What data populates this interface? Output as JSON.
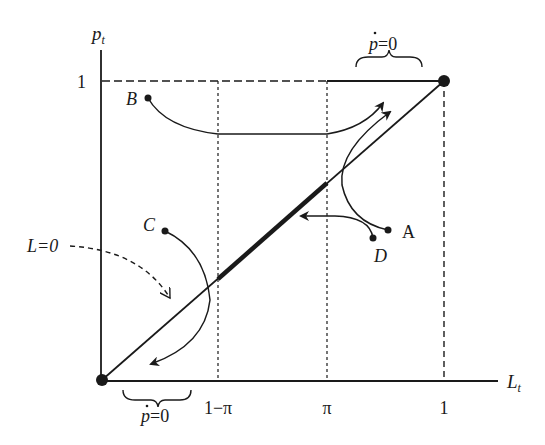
{
  "axes": {
    "y_label": "p",
    "y_label_sub": "t",
    "x_label": "L",
    "x_label_sub": "t",
    "y_tick_1": "1",
    "x_ticks": [
      "1−π",
      "π",
      "1"
    ]
  },
  "points": {
    "A": "A",
    "B": "B",
    "C": "C",
    "D": "D"
  },
  "annotations": {
    "top_brace_label_p": "p",
    "top_brace_label_rest": "=0",
    "bottom_brace_label_p": "p",
    "bottom_brace_label_rest": "=0",
    "l_zero_label": "L=0"
  },
  "colors": {
    "ink": "#1a1a1a",
    "background": "#ffffff"
  }
}
